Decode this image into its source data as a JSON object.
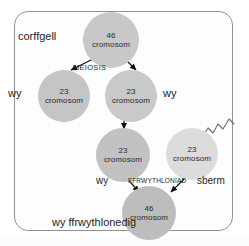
{
  "diagram": {
    "title_label": "corffgell",
    "process_label": "MEIOSIS",
    "fertilisation_label": "FFRWYTHLONIAD",
    "labels": {
      "ovum_left": "wy",
      "ovum_right": "wy",
      "ovum_bottom": "wy",
      "sperm": "sberm",
      "zygote_caption": "wy ffrwythlonedig"
    },
    "cells": [
      {
        "id": "parent",
        "number": "46",
        "unit": "cromosom",
        "color": "#c8c8c8"
      },
      {
        "id": "gamete-left",
        "number": "23",
        "unit": "cromosom",
        "color": "#c5c5c5"
      },
      {
        "id": "gamete-right",
        "number": "23",
        "unit": "cromosom",
        "color": "#c9c9c9"
      },
      {
        "id": "ovum",
        "number": "23",
        "unit": "cromosom",
        "color": "#c2c2c2"
      },
      {
        "id": "sperm",
        "number": "23",
        "unit": "cromosom",
        "color": "#dcdcdc"
      },
      {
        "id": "zygote",
        "number": "46",
        "unit": "cromosom",
        "color": "#bdbdbd"
      }
    ],
    "colors": {
      "frame_border": "#8f9194",
      "background": "#ffffff",
      "text": "#1f1f1f",
      "arrow": "#111111"
    }
  }
}
